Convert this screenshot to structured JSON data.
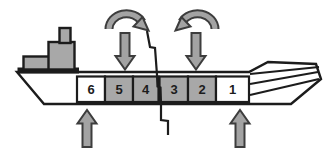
{
  "diagram": {
    "compartments": [
      {
        "label": "6",
        "shaded": false
      },
      {
        "label": "5",
        "shaded": true
      },
      {
        "label": "4",
        "shaded": true
      },
      {
        "label": "3",
        "shaded": true
      },
      {
        "label": "2",
        "shaded": true
      },
      {
        "label": "1",
        "shaded": false
      }
    ],
    "arrows": {
      "rotation_left": "curved-arrow-clockwise",
      "rotation_right": "curved-arrow-counterclockwise",
      "down_arrow_count": 2,
      "up_arrow_count": 2
    },
    "features": {
      "crack": "jagged-fracture-line-through-hull-between-compartments-4-and-3",
      "superstructure": "stern-deckhouse-bridge-funnel",
      "bow_side": "right",
      "stern_side": "left"
    },
    "colors": {
      "background": "#ffffff",
      "outline": "#1c1c1c",
      "shaded_fill": "#a8a8a8",
      "unshaded_fill": "#ffffff",
      "superstructure_fill": "#a8a8a8",
      "arrow_fill": "#a3a3a3",
      "arrow_outline": "#3d3d3d",
      "label_color": "#1c1c1c"
    }
  }
}
